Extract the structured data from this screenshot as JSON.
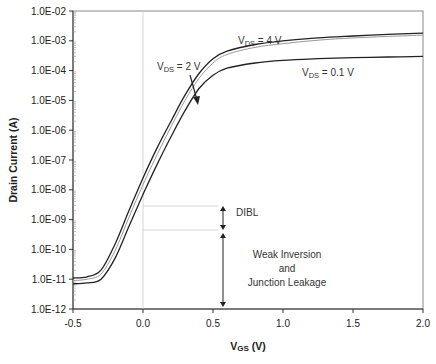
{
  "chart_data": {
    "type": "line",
    "title": "",
    "xlabel": "VGS (V)",
    "xlabel_main": "V",
    "xlabel_sub": "GS",
    "xlabel_unit": " (V)",
    "ylabel": "Drain Current (A)",
    "yscale": "log",
    "xlim": [
      -0.5,
      2.0
    ],
    "ylim": [
      1e-12,
      0.01
    ],
    "xticks": [
      "-0.5",
      "0.0",
      "0.5",
      "1.0",
      "1.5",
      "2.0"
    ],
    "yticks": [
      "1.0E-02",
      "1.0E-03",
      "1.0E-04",
      "1.0E-05",
      "1.0E-06",
      "1.0E-07",
      "1.0E-08",
      "1.0E-09",
      "1.0E-10",
      "1.0E-11",
      "1.0E-12"
    ],
    "grid": false,
    "x": [
      -0.5,
      -0.4,
      -0.3,
      -0.2,
      -0.1,
      0.0,
      0.1,
      0.2,
      0.3,
      0.4,
      0.5,
      0.6,
      0.8,
      1.0,
      1.25,
      1.5,
      1.75,
      2.0
    ],
    "series": [
      {
        "name": "VDS = 4 V",
        "color": "#222222",
        "values": [
          1.1e-11,
          1.2e-11,
          2e-11,
          1.5e-10,
          2e-09,
          2.5e-08,
          2.5e-07,
          2e-06,
          1.5e-05,
          8e-05,
          0.00025,
          0.00045,
          0.00075,
          0.001,
          0.00125,
          0.00145,
          0.00165,
          0.0018
        ]
      },
      {
        "name": "VDS = 2 V",
        "color": "#999999",
        "values": [
          9e-12,
          1e-11,
          1.5e-11,
          9e-11,
          1.2e-09,
          1.5e-08,
          1.5e-07,
          1.3e-06,
          1e-05,
          5.5e-05,
          0.00018,
          0.00035,
          0.0006,
          0.0008,
          0.00105,
          0.00125,
          0.0014,
          0.00155
        ]
      },
      {
        "name": "VDS = 0.1 V",
        "color": "#222222",
        "values": [
          7e-12,
          7.5e-12,
          1e-11,
          5e-11,
          6e-10,
          7e-09,
          7e-08,
          6e-07,
          4.5e-06,
          2.5e-05,
          7e-05,
          0.00012,
          0.00018,
          0.00022,
          0.00025,
          0.00027,
          0.000285,
          0.0003
        ]
      }
    ],
    "annotations": [
      {
        "text": "VDS = 4 V",
        "main": "V",
        "sub": "DS",
        "rest": " = 4 V"
      },
      {
        "text": "VDS = 2 V",
        "main": "V",
        "sub": "DS",
        "rest": " = 2 V"
      },
      {
        "text": "VDS = 0.1 V",
        "main": "V",
        "sub": "DS",
        "rest": " = 0.1 V"
      },
      {
        "text": "DIBL"
      },
      {
        "text": "Weak Inversion"
      },
      {
        "text": "and"
      },
      {
        "text": "Junction Leakage"
      }
    ],
    "legend": "none"
  }
}
